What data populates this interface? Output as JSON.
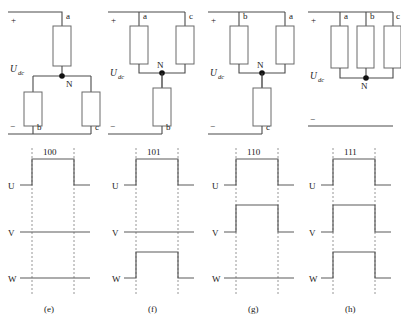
{
  "figure": {
    "supply_label": "U",
    "supply_subscript": "dc",
    "plus_sign": "+",
    "minus_sign": "−",
    "neutral_label": "N",
    "phase_labels": [
      "a",
      "b",
      "c"
    ],
    "signal_labels": [
      "U",
      "V",
      "W"
    ],
    "colors": {
      "wire": "#4a4a4a",
      "resistor_outline": "#6a6a6a",
      "node_fill": "#111111",
      "dashed_guide": "#8a8a8a",
      "signal": "#5a5a5a",
      "background": "#ffffff",
      "text": "#1a1a1a"
    }
  },
  "circuits": [
    {
      "id": "circuit-e",
      "state_code": "100",
      "top_branch_labels": [
        "a"
      ],
      "bottom_branch_labels": [
        "b",
        "c"
      ],
      "neutral_label": "N",
      "plus": "+",
      "minus": "−",
      "supply": "U",
      "supply_sub": "dc",
      "topology": "one-series-two-parallel"
    },
    {
      "id": "circuit-f",
      "state_code": "101",
      "top_branch_labels": [
        "a",
        "c"
      ],
      "bottom_branch_labels": [
        "b"
      ],
      "neutral_label": "N",
      "plus": "+",
      "minus": "−",
      "supply": "U",
      "supply_sub": "dc",
      "topology": "two-parallel-one-series"
    },
    {
      "id": "circuit-g",
      "state_code": "110",
      "top_branch_labels": [
        "b",
        "a"
      ],
      "bottom_branch_labels": [
        "c"
      ],
      "neutral_label": "N",
      "plus": "+",
      "minus": "−",
      "supply": "U",
      "supply_sub": "dc",
      "topology": "two-parallel-one-series"
    },
    {
      "id": "circuit-h",
      "state_code": "111",
      "top_branch_labels": [
        "a",
        "b",
        "c"
      ],
      "bottom_branch_labels": [],
      "neutral_label": "N",
      "plus": "+",
      "minus": "−",
      "supply": "U",
      "supply_sub": "dc",
      "topology": "three-parallel-shorted"
    }
  ],
  "waveforms": [
    {
      "id": "waveform-e",
      "panel_label": "(e)",
      "state_code": "100",
      "signals": [
        {
          "name": "U",
          "level": "high"
        },
        {
          "name": "V",
          "level": "low"
        },
        {
          "name": "W",
          "level": "low"
        }
      ]
    },
    {
      "id": "waveform-f",
      "panel_label": "(f)",
      "state_code": "101",
      "signals": [
        {
          "name": "U",
          "level": "high"
        },
        {
          "name": "V",
          "level": "low"
        },
        {
          "name": "W",
          "level": "high"
        }
      ]
    },
    {
      "id": "waveform-g",
      "panel_label": "(g)",
      "state_code": "110",
      "signals": [
        {
          "name": "U",
          "level": "high"
        },
        {
          "name": "V",
          "level": "high"
        },
        {
          "name": "W",
          "level": "low"
        }
      ]
    },
    {
      "id": "waveform-h",
      "panel_label": "(h)",
      "state_code": "111",
      "signals": [
        {
          "name": "U",
          "level": "high"
        },
        {
          "name": "V",
          "level": "high"
        },
        {
          "name": "W",
          "level": "high"
        }
      ]
    }
  ]
}
